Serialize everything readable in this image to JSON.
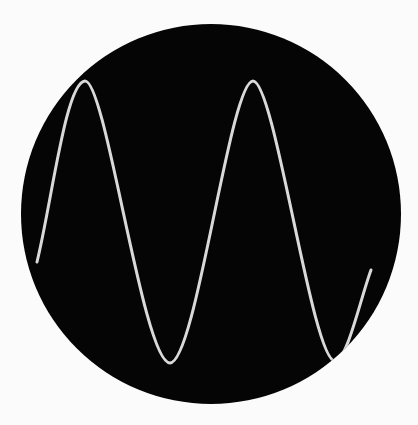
{
  "scene": {
    "description": "Oscilloscope screen showing a sine wave trace",
    "background_color": "#fbfbfb",
    "screen": {
      "cx": 211,
      "cy": 214,
      "r": 190,
      "color": "#050505"
    },
    "trace": {
      "color": "#d9d9d9",
      "width": 3,
      "path": "M37,262 C52,200 66,82 85,81 C106,80 143,363 170,363 C196,363 230,81 253,81 C275,81 312,361 335,361 C347,361 360,300 371,270"
    }
  }
}
